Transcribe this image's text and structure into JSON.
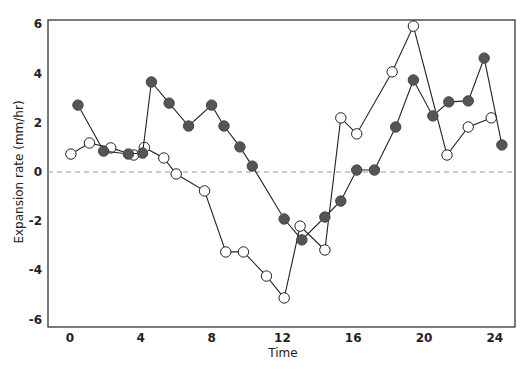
{
  "chart_data": {
    "type": "line",
    "title": "",
    "xlabel": "Time",
    "ylabel": "Expansion rate (mm/hr)",
    "xlim": [
      -1.3,
      25.3
    ],
    "ylim": [
      -6.3,
      6.2
    ],
    "x_ticks": [
      0,
      4,
      8,
      12,
      16,
      20,
      24
    ],
    "x_tick_labels": [
      "0",
      "4",
      "8",
      "12",
      "16",
      "20",
      "24"
    ],
    "y_ticks": [
      6,
      4,
      2,
      0,
      -2,
      -4,
      -6
    ],
    "y_tick_labels": [
      "6",
      "4",
      "2",
      "0",
      "-2",
      "-4",
      "-6"
    ],
    "grid": false,
    "reference_line": {
      "y": 0,
      "style": "dashed",
      "color": "#999999"
    },
    "legend": null,
    "series": [
      {
        "name": "open circles",
        "marker": "open-circle",
        "color": "#222222",
        "x": [
          0.05,
          1.1,
          2.3,
          3.6,
          4.2,
          5.3,
          6.0,
          7.6,
          8.8,
          9.8,
          11.1,
          12.1,
          13.0,
          14.4,
          15.3,
          16.2,
          18.2,
          19.4,
          21.3,
          22.5,
          23.8
        ],
        "values": [
          0.73,
          1.18,
          0.98,
          0.69,
          1.0,
          0.57,
          -0.08,
          -0.77,
          -3.25,
          -3.25,
          -4.23,
          -5.12,
          -2.2,
          -3.17,
          2.2,
          1.55,
          4.07,
          5.93,
          0.69,
          1.83,
          2.2
        ]
      },
      {
        "name": "filled circles",
        "marker": "filled-circle",
        "color": "#555555",
        "x": [
          0.45,
          1.9,
          3.3,
          4.1,
          4.6,
          5.6,
          6.7,
          8.0,
          8.7,
          9.6,
          10.3,
          12.1,
          13.1,
          14.4,
          15.3,
          16.2,
          17.2,
          18.4,
          19.4,
          20.5,
          21.4,
          22.5,
          23.4,
          24.4
        ],
        "values": [
          2.72,
          0.85,
          0.73,
          0.77,
          3.66,
          2.8,
          1.87,
          2.72,
          1.87,
          1.02,
          0.24,
          -1.91,
          -2.76,
          -1.83,
          -1.18,
          0.08,
          0.08,
          1.83,
          3.74,
          2.28,
          2.85,
          2.89,
          4.63,
          1.1
        ]
      }
    ]
  }
}
